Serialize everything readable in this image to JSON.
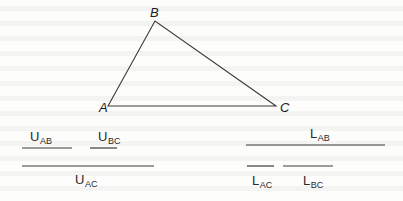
{
  "figure": {
    "triangle": {
      "vertices": [
        {
          "name": "A",
          "x": 108,
          "y": 106
        },
        {
          "name": "B",
          "x": 155,
          "y": 21
        },
        {
          "name": "C",
          "x": 276,
          "y": 106
        }
      ],
      "labels": {
        "A": "A",
        "B": "B",
        "C": "C"
      }
    },
    "upper_segments": {
      "AB": {
        "main": "U",
        "sub": "AB",
        "x1": 22,
        "x2": 72,
        "y": 148
      },
      "BC": {
        "main": "U",
        "sub": "BC",
        "x1": 90,
        "x2": 117,
        "y": 148
      },
      "AC": {
        "main": "U",
        "sub": "AC",
        "x1": 22,
        "x2": 154,
        "y": 166
      }
    },
    "lower_segments": {
      "AB": {
        "main": "L",
        "sub": "AB",
        "x1": 246,
        "x2": 385,
        "y": 145
      },
      "AC": {
        "main": "L",
        "sub": "AC",
        "x1": 247,
        "x2": 274,
        "y": 166
      },
      "BC": {
        "main": "L",
        "sub": "BC",
        "x1": 283,
        "x2": 333,
        "y": 166
      }
    },
    "colors": {
      "line": "#3a3a3a",
      "text": "#222222",
      "background": "#fdfdfc"
    }
  }
}
